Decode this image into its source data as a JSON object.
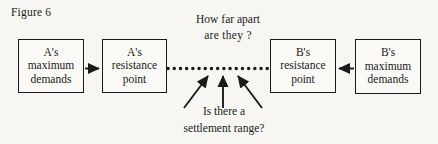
{
  "figure": {
    "label": "Figure 6",
    "background_color": "#f7f6f3",
    "ink_color": "#1a1a1a"
  },
  "boxes": [
    {
      "id": "a-maximum-demands",
      "line1": "A's",
      "line2": "maximum",
      "line3": "demands"
    },
    {
      "id": "a-resistance-point",
      "line1": "A's",
      "line2": "resistance",
      "line3": "point"
    },
    {
      "id": "b-resistance-point",
      "line1": "B's",
      "line2": "resistance",
      "line3": "point"
    },
    {
      "id": "b-maximum-demands",
      "line1": "B's",
      "line2": "maximum",
      "line3": "demands"
    }
  ],
  "annotations": {
    "top_question": {
      "line1": "How far apart",
      "line2": "are they ?"
    },
    "bottom_question": {
      "line1": "Is there a",
      "line2": "settlement range?"
    }
  },
  "connectors": {
    "left_arrow_name": "arrow-a-max-to-a-resistance",
    "right_arrow_name": "arrow-b-max-to-b-resistance",
    "dotted_span_name": "dotted-bargaining-range",
    "dot_count": 17
  }
}
